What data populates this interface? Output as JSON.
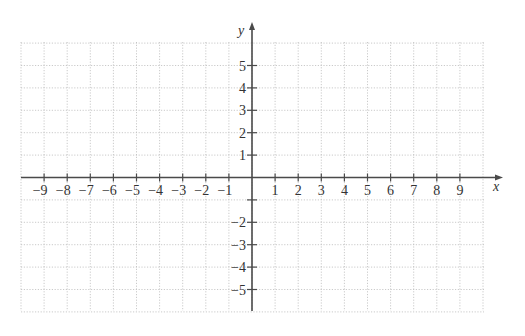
{
  "diagram": {
    "type": "cartesian-coordinate-plane",
    "x_axis": {
      "label": "x",
      "min": -10,
      "max": 10,
      "tick_labels": [
        "−9",
        "−8",
        "−7",
        "−6",
        "−5",
        "−4",
        "−3",
        "−2",
        "−1",
        "1",
        "2",
        "3",
        "4",
        "5",
        "6",
        "7",
        "8",
        "9"
      ],
      "tick_values": [
        -9,
        -8,
        -7,
        -6,
        -5,
        -4,
        -3,
        -2,
        -1,
        1,
        2,
        3,
        4,
        5,
        6,
        7,
        8,
        9
      ]
    },
    "y_axis": {
      "label": "y",
      "min": -6,
      "max": 6,
      "tick_labels": [
        "5",
        "4",
        "3",
        "2",
        "1",
        "−2",
        "−3",
        "−4",
        "−5"
      ],
      "tick_values": [
        5,
        4,
        3,
        2,
        1,
        -2,
        -3,
        -4,
        -5
      ],
      "unlabeled_ticks": [
        -1
      ]
    },
    "grid": {
      "style": "dotted",
      "color": "#bdbdbd"
    },
    "axis_color": "#4a4a4a"
  }
}
